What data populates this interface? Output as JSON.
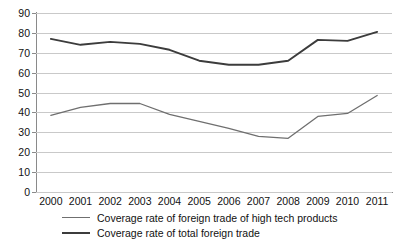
{
  "chart_data": {
    "type": "line",
    "title": "",
    "xlabel": "",
    "ylabel": "",
    "ylim": [
      0,
      90
    ],
    "ytick_step": 10,
    "yticks": [
      0,
      10,
      20,
      30,
      40,
      50,
      60,
      70,
      80,
      90
    ],
    "grid": true,
    "legend_position": "bottom",
    "categories": [
      "2000",
      "2001",
      "2002",
      "2003",
      "2004",
      "2005",
      "2006",
      "2007",
      "2008",
      "2009",
      "2010",
      "2011"
    ],
    "series": [
      {
        "name": "Coverage rate of foreign trade of high tech products",
        "color": "#6f6f6f",
        "values": [
          38.5,
          42.5,
          44.5,
          44.5,
          39.0,
          35.5,
          32.0,
          28.0,
          27.0,
          38.0,
          39.5,
          48.5
        ]
      },
      {
        "name": "Coverage rate of total foreign trade",
        "color": "#3c3c3c",
        "values": [
          77.0,
          74.0,
          75.5,
          74.5,
          71.5,
          66.0,
          64.0,
          64.0,
          66.0,
          76.5,
          76.0,
          80.5
        ]
      }
    ]
  },
  "axes": {
    "y_labels": [
      "90",
      "80",
      "70",
      "60",
      "50",
      "40",
      "30",
      "20",
      "10",
      "0"
    ],
    "x_labels": [
      "2000",
      "2001",
      "2002",
      "2003",
      "2004",
      "2005",
      "2006",
      "2007",
      "2008",
      "2009",
      "2010",
      "2011"
    ]
  },
  "legend": {
    "items": [
      {
        "label": "Coverage rate of foreign trade of high tech products"
      },
      {
        "label": "Coverage rate of total foreign trade"
      }
    ]
  },
  "title_sliver": {
    "text": ""
  }
}
